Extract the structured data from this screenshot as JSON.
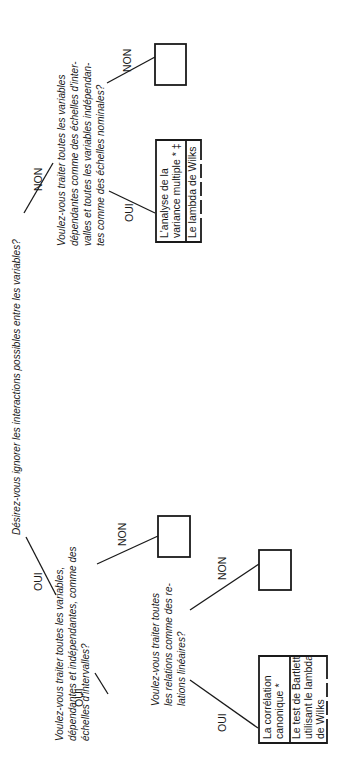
{
  "diagram": {
    "orientation": "rotated-90-ccw",
    "root": {
      "question": "Désirez-vous ignorer les interactions possibles entre les variables?"
    },
    "branches": {
      "non": {
        "label": "NON",
        "question_lines": [
          "Voulez-vous traiter toutes les variables",
          "dépendantes comme des échelles d'inter-",
          "valles et toutes les variables indépendan-",
          "tes comme des échelles nominales?"
        ],
        "oui": {
          "label": "OUI",
          "box": {
            "method_lines": [
              "L'analyse de la",
              "variance multiple * ‡"
            ],
            "test_lines": [
              "Le lambda de Wilks"
            ]
          }
        },
        "non": {
          "label": "NON",
          "box": {
            "empty": true
          }
        }
      },
      "oui": {
        "label": "OUI",
        "question_lines": [
          "Voulez-vous traiter toutes les variables,",
          "dépendantes et indépendantes, comme des",
          "échelles d'intervalles?"
        ],
        "non": {
          "label": "NON",
          "box": {
            "empty": true
          }
        },
        "oui": {
          "label": "OUI",
          "question_lines": [
            "Voulez-vous traiter toutes",
            "les relations comme des re-",
            "lations linéaires?"
          ],
          "non": {
            "label": "NON",
            "box": {
              "empty": true
            }
          },
          "oui": {
            "label": "OUI",
            "box": {
              "method_lines": [
                "La corrélation",
                "canonique *"
              ],
              "test_lines": [
                "Le test de Bartlett",
                "utilisant le lambda",
                "de Wilks"
              ]
            }
          }
        }
      }
    }
  }
}
